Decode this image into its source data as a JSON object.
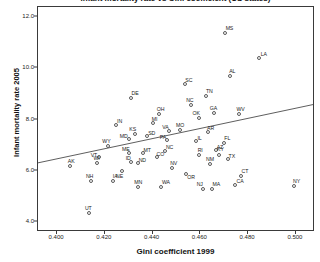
{
  "chart_data": {
    "type": "scatter",
    "title": "Infant mortality rate vs Gini coefficient (US states)",
    "xlabel": "Gini coefficient 1999",
    "ylabel": "Infant mortality rate 2005",
    "xlim": [
      0.392,
      0.508
    ],
    "ylim": [
      3.6,
      12.4
    ],
    "xticks": [
      "0.400",
      "0.420",
      "0.440",
      "0.460",
      "0.480",
      "0.500"
    ],
    "xtick_values": [
      0.4,
      0.42,
      0.44,
      0.46,
      0.48,
      0.5
    ],
    "yticks": [
      "4.0",
      "6.0",
      "8.0",
      "10.0",
      "12.0"
    ],
    "ytick_values": [
      4.0,
      6.0,
      8.0,
      10.0,
      12.0
    ],
    "grid": false,
    "legend": null,
    "trendline": {
      "type": "linear",
      "x0": 0.392,
      "y0": 6.25,
      "x1": 0.508,
      "y1": 8.55
    },
    "point_label_key": "state",
    "points": [
      {
        "state": "MS",
        "x": 0.4705,
        "y": 11.4
      },
      {
        "state": "LA",
        "x": 0.4845,
        "y": 10.4
      },
      {
        "state": "AL",
        "x": 0.4725,
        "y": 9.7
      },
      {
        "state": "SC",
        "x": 0.4535,
        "y": 9.4
      },
      {
        "state": "DE",
        "x": 0.431,
        "y": 8.85
      },
      {
        "state": "TN",
        "x": 0.4625,
        "y": 8.9
      },
      {
        "state": "NC",
        "x": 0.456,
        "y": 8.55
      },
      {
        "state": "OH",
        "x": 0.4425,
        "y": 8.2
      },
      {
        "state": "GA",
        "x": 0.4655,
        "y": 8.25
      },
      {
        "state": "WV",
        "x": 0.476,
        "y": 8.2
      },
      {
        "state": "OK",
        "x": 0.4595,
        "y": 8.05
      },
      {
        "state": "MI",
        "x": 0.44,
        "y": 7.85
      },
      {
        "state": "IN",
        "x": 0.4245,
        "y": 7.8
      },
      {
        "state": "MO",
        "x": 0.4515,
        "y": 7.6
      },
      {
        "state": "VA",
        "x": 0.447,
        "y": 7.55
      },
      {
        "state": "AR",
        "x": 0.463,
        "y": 7.5
      },
      {
        "state": "KS",
        "x": 0.4325,
        "y": 7.45
      },
      {
        "state": "SD",
        "x": 0.4375,
        "y": 7.35
      },
      {
        "state": "MD",
        "x": 0.43,
        "y": 7.25
      },
      {
        "state": "PA",
        "x": 0.446,
        "y": 7.2
      },
      {
        "state": "IL",
        "x": 0.458,
        "y": 7.15
      },
      {
        "state": "FL",
        "x": 0.47,
        "y": 7.1
      },
      {
        "state": "WY",
        "x": 0.4215,
        "y": 6.95
      },
      {
        "state": "AZ",
        "x": 0.4665,
        "y": 6.8
      },
      {
        "state": "RI",
        "x": 0.4595,
        "y": 6.6
      },
      {
        "state": "KY",
        "x": 0.468,
        "y": 6.6
      },
      {
        "state": "ME",
        "x": 0.43,
        "y": 6.7
      },
      {
        "state": "MT",
        "x": 0.436,
        "y": 6.7
      },
      {
        "state": "CO",
        "x": 0.442,
        "y": 6.55
      },
      {
        "state": "NC2",
        "x": 0.445,
        "y": 6.75
      },
      {
        "state": "VT",
        "x": 0.4175,
        "y": 6.55
      },
      {
        "state": "TX",
        "x": 0.4715,
        "y": 6.45
      },
      {
        "state": "ID",
        "x": 0.431,
        "y": 6.35
      },
      {
        "state": "ND",
        "x": 0.434,
        "y": 6.3
      },
      {
        "state": "NM",
        "x": 0.464,
        "y": 6.25
      },
      {
        "state": "AK",
        "x": 0.4055,
        "y": 6.2
      },
      {
        "state": "WI",
        "x": 0.4165,
        "y": 6.3
      },
      {
        "state": "NV",
        "x": 0.448,
        "y": 6.1
      },
      {
        "state": "NE",
        "x": 0.427,
        "y": 6.0
      },
      {
        "state": "OR",
        "x": 0.454,
        "y": 5.85
      },
      {
        "state": "CT",
        "x": 0.477,
        "y": 5.8
      },
      {
        "state": "NH",
        "x": 0.414,
        "y": 5.6
      },
      {
        "state": "IA",
        "x": 0.4235,
        "y": 5.6
      },
      {
        "state": "CA",
        "x": 0.4745,
        "y": 5.45
      },
      {
        "state": "WA",
        "x": 0.4435,
        "y": 5.35
      },
      {
        "state": "MN",
        "x": 0.434,
        "y": 5.35
      },
      {
        "state": "NJ",
        "x": 0.461,
        "y": 5.3
      },
      {
        "state": "MA",
        "x": 0.465,
        "y": 5.3
      },
      {
        "state": "NY",
        "x": 0.499,
        "y": 5.4
      },
      {
        "state": "UT",
        "x": 0.4135,
        "y": 4.35
      }
    ],
    "label_offsets": {
      "MS": [
        4,
        -5
      ],
      "LA": [
        5,
        -4
      ],
      "AL": [
        2,
        -5
      ],
      "SC": [
        4,
        -4
      ],
      "DE": [
        4,
        -5
      ],
      "TN": [
        3,
        -5
      ],
      "NC": [
        -1,
        -5
      ],
      "OH": [
        2,
        -5
      ],
      "GA": [
        0,
        -5
      ],
      "WV": [
        2,
        -5
      ],
      "OK": [
        -3,
        -5
      ],
      "MI": [
        2,
        -4
      ],
      "IN": [
        4,
        -4
      ],
      "MO": [
        0,
        -5
      ],
      "VA": [
        -4,
        -4
      ],
      "AR": [
        3,
        -4
      ],
      "KS": [
        -2,
        -5
      ],
      "SD": [
        5,
        -3
      ],
      "MD": [
        -5,
        -3
      ],
      "PA": [
        -4,
        -3
      ],
      "IL": [
        4,
        -3
      ],
      "FL": [
        3,
        -5
      ],
      "WY": [
        -2,
        -5
      ],
      "AZ": [
        4,
        -3
      ],
      "RI": [
        1,
        -5
      ],
      "KY": [
        1,
        -6
      ],
      "ME": [
        -3,
        -4
      ],
      "MT": [
        4,
        -3
      ],
      "CO": [
        3,
        -3
      ],
      "NC2": [
        5,
        -4
      ],
      "VT": [
        -5,
        -2
      ],
      "TX": [
        4,
        -3
      ],
      "ID": [
        -3,
        -4
      ],
      "ND": [
        4,
        -3
      ],
      "NM": [
        0,
        -5
      ],
      "AK": [
        1,
        -5
      ],
      "WI": [
        0,
        -5
      ],
      "NV": [
        2,
        -5
      ],
      "NE": [
        -2,
        5
      ],
      "OR": [
        5,
        3
      ],
      "CT": [
        4,
        -5
      ],
      "NH": [
        -1,
        -5
      ],
      "IA": [
        2,
        -5
      ],
      "CA": [
        5,
        -4
      ],
      "WA": [
        5,
        -5
      ],
      "MN": [
        0,
        -5
      ],
      "NJ": [
        -3,
        -5
      ],
      "MA": [
        4,
        -5
      ],
      "NY": [
        3,
        -5
      ],
      "UT": [
        -1,
        -5
      ]
    }
  }
}
